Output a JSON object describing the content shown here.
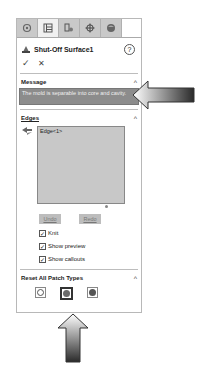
{
  "panel": {
    "tabs": [
      {
        "icon": "feature-manager-icon",
        "active": false
      },
      {
        "icon": "property-manager-icon",
        "active": true
      },
      {
        "icon": "configuration-manager-icon",
        "active": false
      },
      {
        "icon": "dimxpert-icon",
        "active": false
      },
      {
        "icon": "display-manager-icon",
        "active": false
      }
    ],
    "title": "Shut-Off Surface1",
    "help_icon": "?",
    "ok_icon": "✓",
    "cancel_icon": "✕"
  },
  "message": {
    "title": "Message",
    "text": "The mold is separable into core and cavity."
  },
  "edges": {
    "title": "Edges",
    "list_items": [
      "Edge<1>"
    ],
    "undo_label": "Undo",
    "redo_label": "Redo",
    "checkboxes": [
      {
        "label": "Knit",
        "checked": true
      },
      {
        "label": "Show preview",
        "checked": true
      },
      {
        "label": "Show callouts",
        "checked": true
      }
    ]
  },
  "reset": {
    "title": "Reset All Patch Types",
    "patch_types": [
      {
        "name": "contact",
        "selected": false
      },
      {
        "name": "tangent",
        "selected": true
      },
      {
        "name": "no-fill",
        "selected": false
      }
    ]
  },
  "colors": {
    "message_bg": "#8c8c8c",
    "list_bg": "#c8c8c8",
    "tab_bar": "#c9c9c9"
  }
}
